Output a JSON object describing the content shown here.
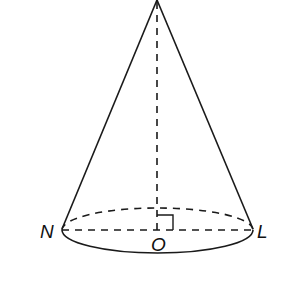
{
  "figure": {
    "type": "cone",
    "colors": {
      "stroke": "#1a1a1a",
      "background": "#ffffff"
    },
    "labels": {
      "left_point": "N",
      "right_point": "L",
      "center": "O"
    },
    "marks": [
      "right-angle at O"
    ]
  }
}
